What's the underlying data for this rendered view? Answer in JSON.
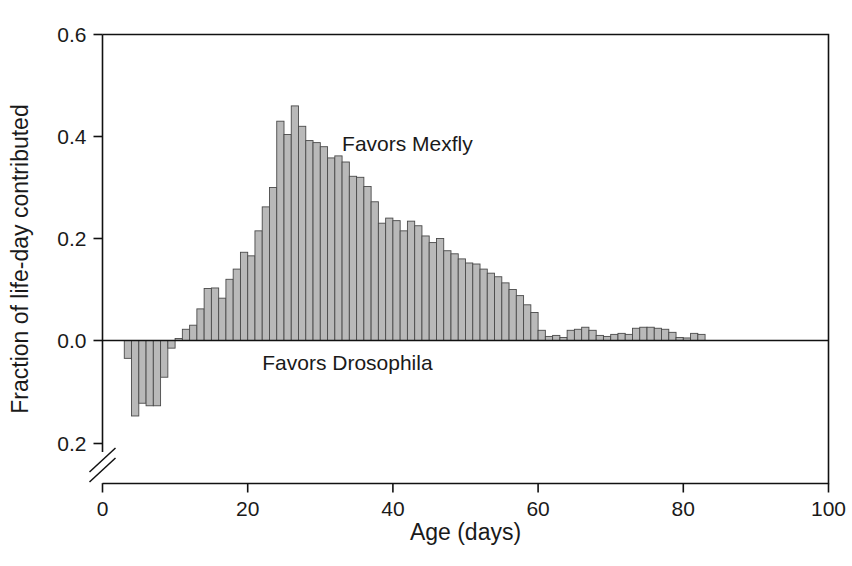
{
  "figure": {
    "background": "#ffffff",
    "bar_fill": "#b9b9b9",
    "bar_stroke": "#4a4a4a",
    "axis_color": "#111111"
  },
  "annotations": {
    "favors_mexfly": "Favors Mexfly",
    "favors_drosophila": "Favors Drosophila"
  },
  "axis": {
    "y_title": "Fraction of life-day contributed",
    "x_title": "Age (days)",
    "x_ticks": [
      "0",
      "20",
      "40",
      "60",
      "80",
      "100"
    ],
    "y_ticks": [
      "0.6",
      "0.4",
      "0.2",
      "0.0",
      "0.2"
    ]
  },
  "chart_data": {
    "type": "bar",
    "title": "",
    "xlabel": "Age (days)",
    "ylabel": "Fraction of life-day contributed",
    "xlim": [
      0,
      100
    ],
    "ylim": [
      -0.22,
      0.6
    ],
    "grid": false,
    "legend": null,
    "y_tick_values": [
      0.6,
      0.4,
      0.2,
      0.0,
      -0.2
    ],
    "y_tick_labels": [
      "0.6",
      "0.4",
      "0.2",
      "0.0",
      "0.2"
    ],
    "x_tick_values": [
      0,
      20,
      40,
      60,
      80,
      100
    ],
    "x_tick_labels": [
      "0",
      "20",
      "40",
      "60",
      "80",
      "100"
    ],
    "axis_break": {
      "axis": "y",
      "position": -0.21,
      "style": "double-slash"
    },
    "bar_width_days": 1,
    "annotations": [
      {
        "text": "Favors Mexfly",
        "x": 33,
        "y": 0.385
      },
      {
        "text": "Favors Drosophila",
        "x": 22,
        "y": -0.045
      }
    ],
    "x": [
      3,
      4,
      5,
      6,
      7,
      8,
      9,
      10,
      11,
      12,
      13,
      14,
      15,
      16,
      17,
      18,
      19,
      20,
      21,
      22,
      23,
      24,
      25,
      26,
      27,
      28,
      29,
      30,
      31,
      32,
      33,
      34,
      35,
      36,
      37,
      38,
      39,
      40,
      41,
      42,
      43,
      44,
      45,
      46,
      47,
      48,
      49,
      50,
      51,
      52,
      53,
      54,
      55,
      56,
      57,
      58,
      59,
      60,
      61,
      62,
      63,
      64,
      65,
      66,
      67,
      68,
      69,
      70,
      71,
      72,
      73,
      74,
      75,
      76,
      77,
      78,
      79,
      80,
      81,
      82
    ],
    "values": [
      -0.035,
      -0.148,
      -0.123,
      -0.128,
      -0.128,
      -0.072,
      -0.015,
      0.004,
      0.022,
      0.03,
      0.062,
      0.102,
      0.103,
      0.083,
      0.12,
      0.14,
      0.173,
      0.166,
      0.215,
      0.262,
      0.3,
      0.43,
      0.404,
      0.46,
      0.42,
      0.392,
      0.388,
      0.38,
      0.358,
      0.362,
      0.35,
      0.322,
      0.32,
      0.302,
      0.272,
      0.23,
      0.24,
      0.235,
      0.215,
      0.234,
      0.225,
      0.205,
      0.192,
      0.2,
      0.176,
      0.17,
      0.16,
      0.152,
      0.15,
      0.14,
      0.132,
      0.125,
      0.113,
      0.1,
      0.088,
      0.07,
      0.055,
      0.02,
      0.008,
      0.01,
      0.006,
      0.02,
      0.022,
      0.026,
      0.02,
      0.01,
      0.008,
      0.012,
      0.014,
      0.012,
      0.024,
      0.026,
      0.026,
      0.024,
      0.022,
      0.016,
      0.006,
      0.005,
      0.014,
      0.012
    ]
  }
}
